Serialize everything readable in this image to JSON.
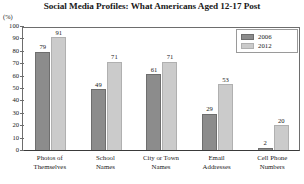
{
  "chart_data": {
    "type": "bar",
    "title": "Social Media Profiles: What Americans Aged 12-17 Post",
    "xlabel": "",
    "ylabel": "(%)",
    "ylim": [
      0,
      100
    ],
    "yticks": [
      0,
      10,
      20,
      30,
      40,
      50,
      60,
      70,
      80,
      90,
      100
    ],
    "grid": false,
    "legend_position": "top-right",
    "categories": [
      "Photos of Themselves",
      "School Names",
      "City or Town Names",
      "Email Addresses",
      "Cell Phone Numbers"
    ],
    "category_lines": [
      [
        "Photos of",
        "Themselves"
      ],
      [
        "School",
        "Names"
      ],
      [
        "City or Town",
        "Names"
      ],
      [
        "Email",
        "Addresses"
      ],
      [
        "Cell Phone",
        "Numbers"
      ]
    ],
    "series": [
      {
        "name": "2006",
        "color": "#8c8c8c",
        "values": [
          79,
          49,
          61,
          29,
          2
        ]
      },
      {
        "name": "2012",
        "color": "#cbcbcb",
        "values": [
          91,
          71,
          71,
          53,
          20
        ]
      }
    ]
  }
}
